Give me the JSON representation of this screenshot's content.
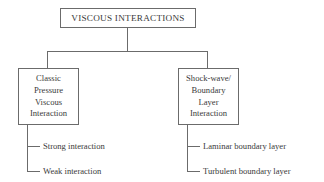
{
  "diagram": {
    "type": "hierarchy-tree",
    "title": "VISCOUS INTERACTIONS",
    "line_color": "#6b6b6b",
    "text_color": "#3a3a3a",
    "background_color": "#ffffff",
    "root": {
      "label": "VISCOUS INTERACTIONS"
    },
    "branches": [
      {
        "id": "classic-pressure-viscous-interaction",
        "lines": [
          "Classic",
          "Pressure",
          "Viscous",
          "Interaction"
        ],
        "leaves": [
          {
            "label": "Strong interaction"
          },
          {
            "label": "Weak interaction"
          }
        ]
      },
      {
        "id": "shock-wave-boundary-layer-interaction",
        "lines": [
          "Shock-wave/",
          "Boundary",
          "Layer",
          "Interaction"
        ],
        "leaves": [
          {
            "label": "Laminar boundary layer"
          },
          {
            "label": "Turbulent boundary layer"
          }
        ]
      }
    ]
  }
}
